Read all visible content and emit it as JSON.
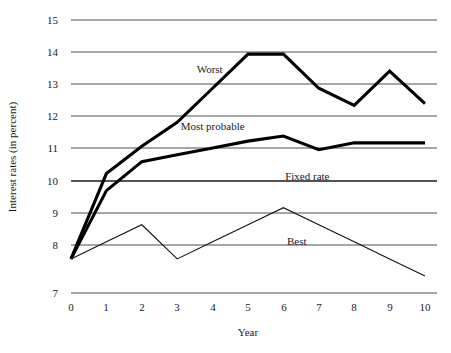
{
  "chart_data": {
    "type": "line",
    "title": "",
    "xlabel": "Year",
    "ylabel": "Interest rates (in percent)",
    "xlim": [
      0,
      10
    ],
    "ylim": [
      7,
      15
    ],
    "grid": true,
    "legend_position": "inline-annotations",
    "x": [
      0,
      1,
      2,
      3,
      4,
      5,
      6,
      7,
      8,
      9,
      10
    ],
    "xticks": [
      "0",
      "1",
      "2",
      "3",
      "4",
      "5",
      "6",
      "7",
      "8",
      "9",
      "10"
    ],
    "yticks": [
      "7",
      "8",
      "9",
      "10",
      "11",
      "12",
      "13",
      "14",
      "15"
    ],
    "series": [
      {
        "name": "Worst",
        "style": "thick",
        "values": [
          8.0,
          10.5,
          11.3,
          12.0,
          13.0,
          14.0,
          14.0,
          13.0,
          12.5,
          13.5,
          12.55
        ]
      },
      {
        "name": "Most probable",
        "style": "thick",
        "values": [
          8.0,
          10.0,
          10.85,
          11.05,
          11.25,
          11.45,
          11.6,
          11.2,
          11.4,
          11.4,
          11.4
        ]
      },
      {
        "name": "Best",
        "style": "thin",
        "values": [
          8.0,
          8.5,
          9.0,
          8.0,
          8.5,
          9.0,
          9.5,
          9.0,
          8.5,
          8.0,
          7.5
        ]
      }
    ],
    "annotations": [
      {
        "text": "Worst",
        "x": 3.55,
        "y": 13.45
      },
      {
        "text": "Most probable",
        "x": 3.1,
        "y": 11.78
      },
      {
        "text": "Fixed rate",
        "x": 6.05,
        "y": 10.32
      },
      {
        "text": "Best",
        "x": 6.1,
        "y": 8.42
      }
    ]
  }
}
